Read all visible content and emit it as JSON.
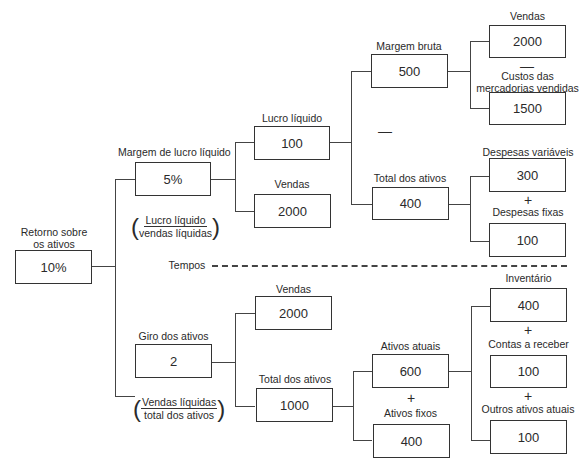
{
  "root": {
    "label": "Retorno sobre\nos ativos",
    "label_line1": "Retorno sobre",
    "label_line2": "os ativos",
    "value": "10%"
  },
  "top": {
    "margem_lucro_liquido": {
      "label": "Margem de lucro líquido",
      "value": "5%",
      "formula": {
        "numerator": "Lucro líquido",
        "denominator": "vendas líquidas"
      }
    },
    "lucro_liquido": {
      "label": "Lucro líquido",
      "value": "100"
    },
    "vendas": {
      "label": "Vendas",
      "value": "2000"
    },
    "margem_bruta": {
      "label": "Margem bruta",
      "value": "500"
    },
    "total_dos_ativos": {
      "label": "Total dos ativos",
      "value": "400"
    },
    "vendas_mb": {
      "label": "Vendas",
      "value": "2000"
    },
    "custos": {
      "label_line1": "Custos das",
      "label_line2": "mercadorias vendidas",
      "value": "1500"
    },
    "despesas_variaveis": {
      "label": "Despesas variáveis",
      "value": "300"
    },
    "despesas_fixas": {
      "label": "Despesas fixas",
      "value": "100"
    }
  },
  "separator": {
    "label": "Tempos"
  },
  "bottom": {
    "giro_dos_ativos": {
      "label": "Giro dos ativos",
      "value": "2",
      "formula": {
        "numerator": "Vendas líquidas",
        "denominator": "total dos ativos"
      }
    },
    "vendas": {
      "label": "Vendas",
      "value": "2000"
    },
    "total_dos_ativos": {
      "label": "Total dos ativos",
      "value": "1000"
    },
    "ativos_atuais": {
      "label": "Ativos atuais",
      "value": "600"
    },
    "ativos_fixos": {
      "label": "Ativos fixos",
      "value": "400"
    },
    "inventario": {
      "label": "Inventário",
      "value": "400"
    },
    "contas_a_receber": {
      "label": "Contas a receber",
      "value": "100"
    },
    "outros_ativos_atuais": {
      "label": "Outros ativos atuais",
      "value": "100"
    }
  },
  "operators": {
    "minus": "—",
    "plus": "+"
  }
}
